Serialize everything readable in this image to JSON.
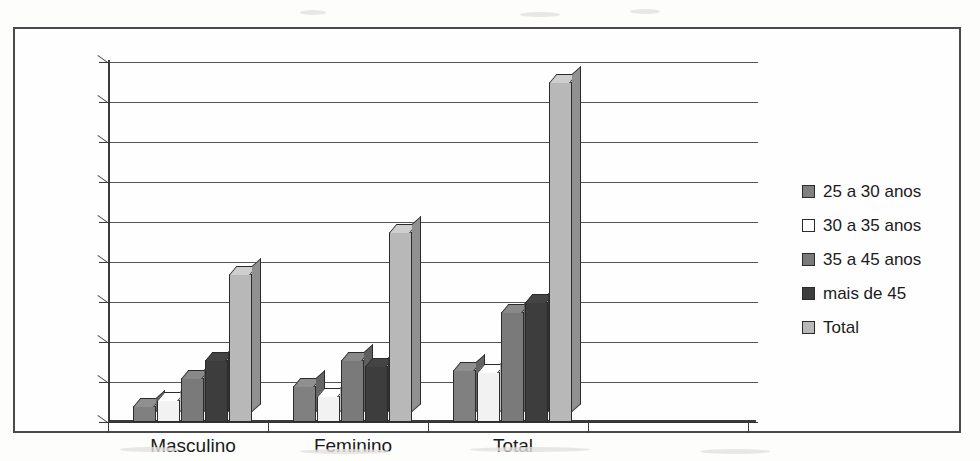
{
  "chart_data": {
    "type": "bar",
    "title": "",
    "subtitle": "",
    "xlabel": "",
    "ylabel": "",
    "categories": [
      "Masculino",
      "Feminino",
      "Total"
    ],
    "series": [
      {
        "name": "25 a 30 anos",
        "color": "#808080",
        "values": [
          20,
          45,
          65
        ]
      },
      {
        "name": "30 a 35 anos",
        "color": "#f2f2f2",
        "values": [
          27,
          33,
          62
        ]
      },
      {
        "name": "35 a 45 anos",
        "color": "#7a7a7a",
        "values": [
          55,
          78,
          138
        ]
      },
      {
        "name": "mais de 45",
        "color": "#3d3d3d",
        "values": [
          78,
          70,
          150
        ]
      },
      {
        "name": "Total",
        "color": "#b8b8b8",
        "values": [
          185,
          237,
          425
        ]
      }
    ],
    "yticks": [
      0,
      50,
      100,
      150,
      200,
      250,
      300,
      350,
      400,
      450
    ],
    "ylim": [
      0,
      450
    ],
    "grid": true,
    "legend_position": "right",
    "style": "3d-column"
  },
  "legend": {
    "items": [
      {
        "label": "25 a 30 anos",
        "swatch": "#808080"
      },
      {
        "label": "30 a 35 anos",
        "swatch": "#ffffff"
      },
      {
        "label": "35 a 45 anos",
        "swatch": "#7a7a7a"
      },
      {
        "label": "mais de 45",
        "swatch": "#3d3d3d"
      },
      {
        "label": "Total",
        "swatch": "#b8b8b8"
      }
    ]
  },
  "axes": {
    "y_labels": [
      "450",
      "400",
      "350",
      "300",
      "250",
      "200",
      "150",
      "100",
      "50",
      "0"
    ],
    "x_labels": [
      "Masculino",
      "Feminino",
      "Total"
    ]
  }
}
